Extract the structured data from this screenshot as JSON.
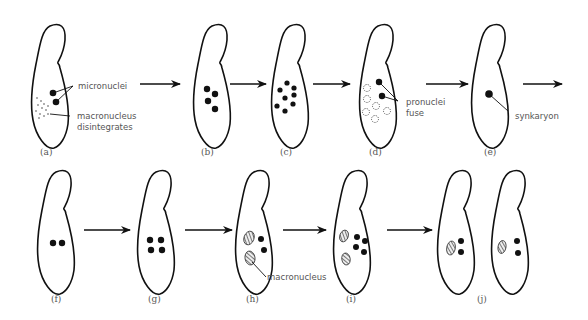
{
  "diagram": {
    "row1": {
      "panels": [
        {
          "id": "a",
          "caption": "(a)",
          "labels": [
            "micronuclei",
            "macronucleus",
            "disintegrates"
          ]
        },
        {
          "id": "b",
          "caption": "(b)"
        },
        {
          "id": "c",
          "caption": "(c)"
        },
        {
          "id": "d",
          "caption": "(d)",
          "labels": [
            "pronuclei",
            "fuse"
          ]
        },
        {
          "id": "e",
          "caption": "(e)",
          "labels": [
            "synkaryon"
          ]
        }
      ]
    },
    "row2": {
      "panels": [
        {
          "id": "f",
          "caption": "(f)"
        },
        {
          "id": "g",
          "caption": "(g)"
        },
        {
          "id": "h",
          "caption": "(h)",
          "labels": [
            "macronucleus"
          ]
        },
        {
          "id": "i",
          "caption": "(i)"
        },
        {
          "id": "j",
          "caption": "(j)"
        }
      ]
    },
    "colors": {
      "outline": "#111111",
      "text": "#555555",
      "background": "#ffffff"
    }
  }
}
